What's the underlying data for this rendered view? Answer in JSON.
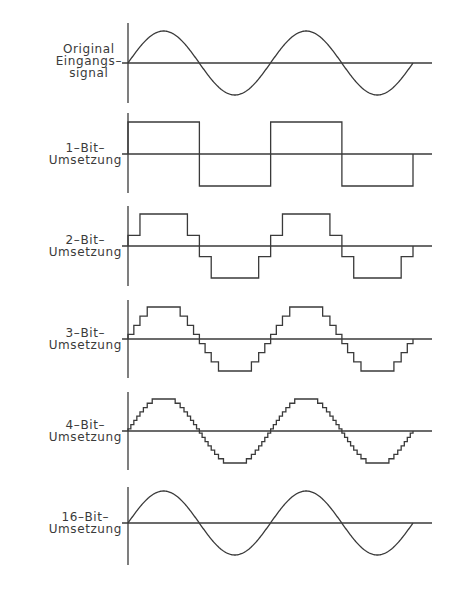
{
  "diagram": {
    "colors": {
      "ink": "#3a3a3a",
      "background": "#ffffff"
    },
    "layout": {
      "axis_x": 128,
      "wave_end_x": 413,
      "zero_line_end_x": 432,
      "half_period_px": 71.25,
      "amplitude_px": 32
    },
    "panels": [
      {
        "id": "original",
        "label_lines": [
          "Original",
          "Eingangs–",
          "signal"
        ],
        "type": "continuous",
        "levels": null,
        "axis_top": 23,
        "axis_bottom": 103,
        "zero_y": 63
      },
      {
        "id": "1bit",
        "label_lines": [
          "1–Bit–",
          "Umsetzung"
        ],
        "type": "quantized",
        "levels": 2,
        "axis_top": 113,
        "axis_bottom": 193,
        "zero_y": 154
      },
      {
        "id": "2bit",
        "label_lines": [
          "2–Bit–",
          "Umsetzung"
        ],
        "type": "quantized",
        "levels": 4,
        "axis_top": 206,
        "axis_bottom": 286,
        "zero_y": 246
      },
      {
        "id": "3bit",
        "label_lines": [
          "3–Bit–",
          "Umsetzung"
        ],
        "type": "quantized",
        "levels": 8,
        "axis_top": 300,
        "axis_bottom": 378,
        "zero_y": 339
      },
      {
        "id": "4bit",
        "label_lines": [
          "4–Bit–",
          "Umsetzung"
        ],
        "type": "quantized",
        "levels": 16,
        "axis_top": 392,
        "axis_bottom": 470,
        "zero_y": 431
      },
      {
        "id": "16bit",
        "label_lines": [
          "16–Bit–",
          "Umsetzung"
        ],
        "type": "continuous",
        "levels": 65536,
        "axis_top": 487,
        "axis_bottom": 565,
        "zero_y": 523
      }
    ]
  }
}
